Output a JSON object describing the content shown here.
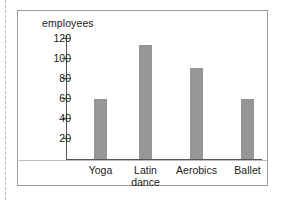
{
  "chart_data": {
    "type": "bar",
    "title": "",
    "subtitle": "",
    "xlabel": "",
    "ylabel": "employees",
    "categories": [
      "Yoga",
      "Latin dance",
      "Aerobics",
      "Ballet"
    ],
    "values": [
      60,
      113,
      90,
      60
    ],
    "ylim": [
      0,
      130
    ],
    "yticks": [
      20,
      40,
      60,
      80,
      100,
      120
    ],
    "ytick_labels": [
      "20",
      "40",
      "60",
      "80",
      "100",
      "120"
    ],
    "grid": false,
    "legend": null,
    "bar_color": "#969696",
    "axis_color": "#555555",
    "series": [
      {
        "name": "employees",
        "values": [
          60,
          113,
          90,
          60
        ]
      }
    ]
  },
  "axis": {
    "y_title": "employees"
  },
  "categories": [
    {
      "label": "Yoga",
      "line1": "Yoga",
      "line2": ""
    },
    {
      "label": "Latin dance",
      "line1": "Latin",
      "line2": "dance"
    },
    {
      "label": "Aerobics",
      "line1": "Aerobics",
      "line2": ""
    },
    {
      "label": "Ballet",
      "line1": "Ballet",
      "line2": ""
    }
  ],
  "ticks": [
    {
      "label": "120"
    },
    {
      "label": "100"
    },
    {
      "label": "80"
    },
    {
      "label": "60"
    },
    {
      "label": "40"
    },
    {
      "label": "20"
    }
  ]
}
